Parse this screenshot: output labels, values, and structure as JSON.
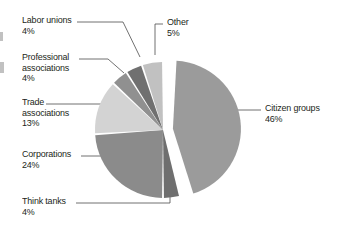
{
  "figure": {
    "background_color": "#ffffff",
    "label_color": "#231f20",
    "leader_line_color": "#4d4d4d"
  },
  "chart_data": {
    "type": "pie",
    "title": "",
    "subtitle": "",
    "xlabel": "",
    "ylabel": "",
    "legend_position": "callout-labels",
    "grid": false,
    "value_suffix": "%",
    "exploded_slice": "Citizen groups",
    "categories": [
      "Citizen groups",
      "Think tanks",
      "Corporations",
      "Trade associations",
      "Professional associations",
      "Labor unions",
      "Other"
    ],
    "values": [
      46,
      4,
      24,
      13,
      4,
      4,
      5
    ],
    "slices": [
      {
        "label": "Citizen groups",
        "value": 46,
        "value_text": "46%",
        "color": "#9b9b9b",
        "exploded": true
      },
      {
        "label": "Think tanks",
        "value": 4,
        "value_text": "4%",
        "color": "#6f6f6f",
        "exploded": false
      },
      {
        "label": "Corporations",
        "value": 24,
        "value_text": "24%",
        "color": "#8b8b8b",
        "exploded": false
      },
      {
        "label": "Trade associations",
        "value": 13,
        "value_text": "13%",
        "color": "#d3d3d3",
        "exploded": false
      },
      {
        "label": "Professional associations",
        "value": 4,
        "value_text": "4%",
        "color": "#909090",
        "exploded": false
      },
      {
        "label": "Labor unions",
        "value": 4,
        "value_text": "4%",
        "color": "#707070",
        "exploded": false
      },
      {
        "label": "Other",
        "value": 5,
        "value_text": "5%",
        "color": "#c1c1c1",
        "exploded": false
      }
    ]
  },
  "callouts": {
    "labor_unions": {
      "name": "Labor unions",
      "value_text": "4%"
    },
    "professional_associations_line1": "Professional",
    "professional_associations_line2": "associations",
    "professional_associations_value": "4%",
    "trade_associations_line1": "Trade",
    "trade_associations_line2": "associations",
    "trade_associations_value": "13%",
    "corporations": {
      "name": "Corporations",
      "value_text": "24%"
    },
    "think_tanks": {
      "name": "Think tanks",
      "value_text": "4%"
    },
    "other": {
      "name": "Other",
      "value_text": "5%"
    },
    "citizen_groups": {
      "name": "Citizen groups",
      "value_text": "46%"
    }
  }
}
